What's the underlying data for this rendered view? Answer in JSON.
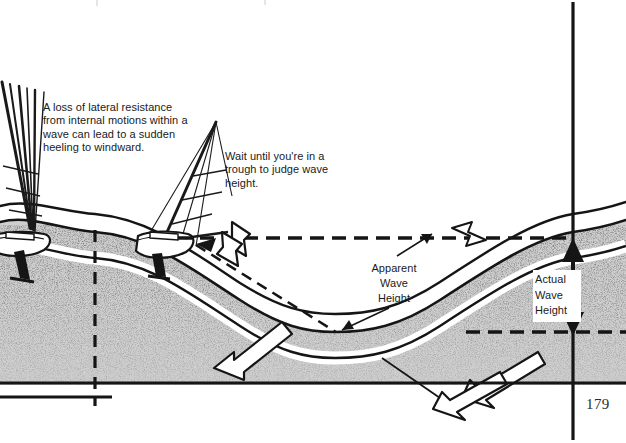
{
  "page": {
    "number": "179",
    "background_color": "#ffffff",
    "ink_color": "#1a1a1a",
    "width": 626,
    "height": 443
  },
  "annotations": [
    {
      "id": "loss-of-lateral-resistance",
      "text": "A loss of lateral resistance from internal motions within a wave can lead to a sudden heeling to windward."
    },
    {
      "id": "wait-until-trough",
      "text": "Wait until you're in a trough to judge wave height."
    }
  ],
  "labels": {
    "apparent_wave_height": "Apparent\nWave\nHeight",
    "actual_wave_height": "Actual\nWave\nHeight"
  },
  "figure": {
    "type": "technical-illustration",
    "water_texture": "stipple",
    "elements": [
      "heeled-sailboat-left",
      "upright-sailboat-crest",
      "wave-profile-curve",
      "crest-datum-dashed-line",
      "trough-datum-dashed-line",
      "apparent-height-dashed-diagonal",
      "actual-height-double-arrow",
      "white-block-arrows",
      "crest-vertical-dashed-line",
      "right-measurement-axis"
    ]
  },
  "colors": {
    "ink": "#1a1a1a",
    "paper": "#ffffff",
    "stipple_dark": "#3b3b3b",
    "stipple_light": "#8a8a8a"
  }
}
